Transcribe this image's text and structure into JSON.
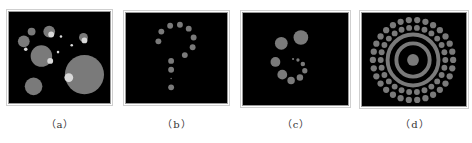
{
  "figure": {
    "panels": [
      {
        "id": "a",
        "caption": "（a）",
        "description": "random scattered circles of varying sizes with bright highlights"
      },
      {
        "id": "b",
        "caption": "（b）",
        "description": "dots arranged in a question mark shape"
      },
      {
        "id": "c",
        "caption": "（c）",
        "description": "dots of decreasing size arranged in a spiral"
      },
      {
        "id": "d",
        "caption": "（d）",
        "description": "concentric rings with outer rings made of dots"
      }
    ]
  },
  "colors": {
    "background": "#000000",
    "circle": "#7a7a7a",
    "highlight": "#d9d9d9"
  }
}
